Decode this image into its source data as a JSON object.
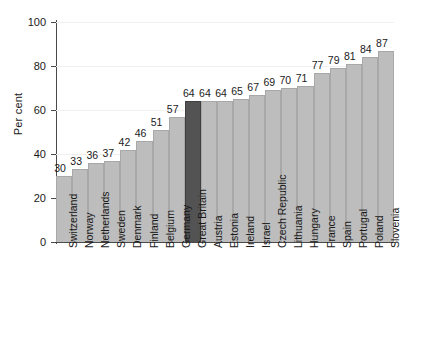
{
  "chart_data": {
    "type": "bar",
    "title": "",
    "xlabel": "",
    "ylabel": "Per cent",
    "ylim": [
      0,
      100
    ],
    "yticks": [
      0,
      20,
      40,
      60,
      80,
      100
    ],
    "grid": true,
    "legend": null,
    "highlight_category": "Great Britain",
    "highlight_color": "#535353",
    "bar_color": "#bdbdbd",
    "categories": [
      "Switzerland",
      "Norway",
      "Netherlands",
      "Sweden",
      "Denmark",
      "Finland",
      "Belgium",
      "Germany",
      "Great Britain",
      "Austria",
      "Estonia",
      "Ireland",
      "Israel",
      "Czech Republic",
      "Lithuania",
      "Hungary",
      "France",
      "Spain",
      "Portugal",
      "Poland",
      "Slovenia"
    ],
    "values": [
      30,
      33,
      36,
      37,
      42,
      46,
      51,
      57,
      64,
      64,
      64,
      65,
      67,
      69,
      70,
      71,
      77,
      79,
      81,
      84,
      87
    ]
  }
}
